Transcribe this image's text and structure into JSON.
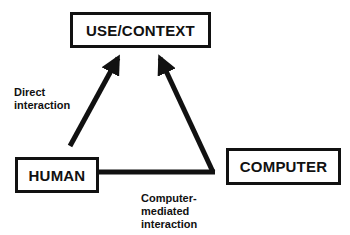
{
  "diagram": {
    "nodes": {
      "use_context": {
        "label": "USE/CONTEXT"
      },
      "human": {
        "label": "HUMAN"
      },
      "computer": {
        "label": "COMPUTER"
      }
    },
    "edges": {
      "direct": {
        "label_line1": "Direct",
        "label_line2": "interaction"
      },
      "mediated": {
        "label_line1": "Computer-",
        "label_line2": "mediated",
        "label_line3": "interaction"
      }
    },
    "colors": {
      "stroke": "#111111",
      "background": "#ffffff"
    }
  }
}
